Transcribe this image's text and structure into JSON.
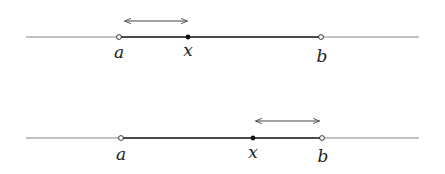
{
  "diagrams": [
    {
      "name": "top",
      "line": {
        "x1": 26,
        "x2": 419,
        "y": 37
      },
      "points": {
        "a": 119,
        "x": 188,
        "b": 321
      },
      "labels": {
        "a": "a",
        "x": "x",
        "b": "b"
      },
      "arrow": {
        "x1": 125,
        "x2": 187,
        "y": 21
      }
    },
    {
      "name": "bottom",
      "line": {
        "x1": 26,
        "x2": 419,
        "y": 138
      },
      "points": {
        "a": 121,
        "x": 253,
        "b": 322
      },
      "labels": {
        "a": "a",
        "x": "x",
        "b": "b"
      },
      "arrow": {
        "x1": 256,
        "x2": 319,
        "y": 121
      }
    }
  ],
  "colors": {
    "line": "#555555",
    "segment": "#222222",
    "point": "#111111"
  }
}
